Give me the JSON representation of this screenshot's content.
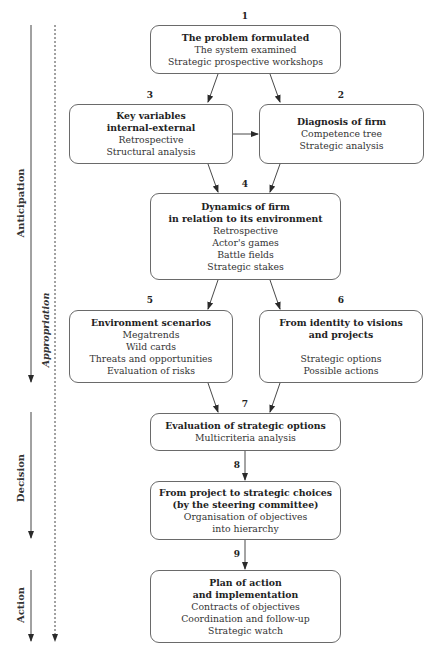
{
  "diagram": {
    "phases": [
      {
        "label": "Anticipation",
        "style": "bold"
      },
      {
        "label": "Appropriation",
        "style": "italic"
      },
      {
        "label": "Decision",
        "style": "bold"
      },
      {
        "label": "Action",
        "style": "bold"
      }
    ],
    "steps": [
      {
        "number": "1",
        "title": "The problem formulated",
        "lines": [
          "The system examined",
          "Strategic prospective workshops"
        ]
      },
      {
        "number": "2",
        "title": "Diagnosis of firm",
        "lines": [
          "Competence tree",
          "Strategic analysis"
        ]
      },
      {
        "number": "3",
        "title": "Key variables\ninternal-external",
        "lines": [
          "Retrospective",
          "Structural analysis"
        ]
      },
      {
        "number": "4",
        "title": "Dynamics of firm\nin relation to its environment",
        "lines": [
          "Retrospective",
          "Actor's games",
          "Battle fields",
          "Strategic stakes"
        ]
      },
      {
        "number": "5",
        "title": "Environment scenarios",
        "lines": [
          "Megatrends",
          "Wild cards",
          "Threats and opportunities",
          "Evaluation of risks"
        ]
      },
      {
        "number": "6",
        "title": "From identity to visions\nand projects",
        "lines": [
          "Strategic options",
          "Possible actions"
        ]
      },
      {
        "number": "7",
        "title": "Evaluation of strategic options",
        "lines": [
          "Multicriteria analysis"
        ]
      },
      {
        "number": "8",
        "title": "From project to strategic choices\n(by the steering committee)",
        "lines": [
          "Organisation of objectives",
          "into hierarchy"
        ]
      },
      {
        "number": "9",
        "title": "Plan of action\nand implementation",
        "lines": [
          "Contracts of objectives",
          "Coordination and follow-up",
          "Strategic watch"
        ]
      }
    ],
    "edges": [
      {
        "from": "1",
        "to": "3"
      },
      {
        "from": "1",
        "to": "2"
      },
      {
        "from": "3",
        "to": "2"
      },
      {
        "from": "3",
        "to": "4"
      },
      {
        "from": "2",
        "to": "4"
      },
      {
        "from": "4",
        "to": "5"
      },
      {
        "from": "4",
        "to": "6"
      },
      {
        "from": "5",
        "to": "7"
      },
      {
        "from": "6",
        "to": "7"
      },
      {
        "from": "7",
        "to": "8"
      },
      {
        "from": "8",
        "to": "9"
      }
    ]
  }
}
